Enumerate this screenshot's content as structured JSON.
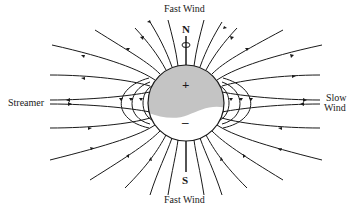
{
  "diagram": {
    "type": "solar-dipole-field",
    "labels": {
      "top": "Fast Wind",
      "bottom": "Fast Wind",
      "left": "Streamer",
      "right_line1": "Slow",
      "right_line2": "Wind",
      "north": "N",
      "south": "S",
      "plus": "+",
      "minus": "–"
    },
    "colors": {
      "line": "#1a1a1a",
      "northern_hemisphere": "#c4c4c4",
      "southern_hemisphere": "#ffffff",
      "background": "#ffffff"
    },
    "sphere": {
      "cx": 186,
      "cy": 103,
      "r": 38
    },
    "field_direction": {
      "northern": "outward",
      "southern": "inward",
      "closed_loops": "north-to-south"
    }
  }
}
